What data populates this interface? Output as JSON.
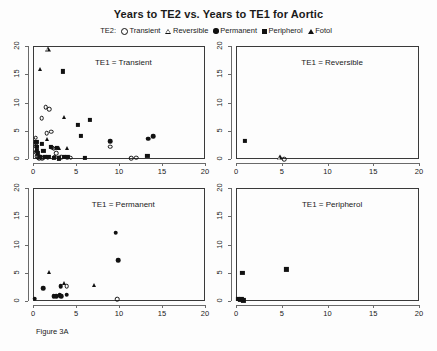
{
  "figure": {
    "title": "Years to TE2 vs. Years to TE1 for Aortic",
    "caption": "Figure 3A",
    "legend_prefix": "TE2:"
  },
  "legend": {
    "entries": [
      {
        "label": "Transient",
        "glyph": "open-circle-icon"
      },
      {
        "label": "Reversible",
        "glyph": "open-triangle-icon"
      },
      {
        "label": "Permanent",
        "glyph": "filled-circle-icon"
      },
      {
        "label": "Peripherol",
        "glyph": "filled-square-icon"
      },
      {
        "label": "Fotol",
        "glyph": "filled-triangle-icon"
      }
    ]
  },
  "axes": {
    "xticks": [
      "0",
      "5",
      "10",
      "15",
      "20"
    ],
    "yticks": [
      "0",
      "5",
      "10",
      "15",
      "20"
    ],
    "xlim": [
      0,
      20
    ],
    "ylim": [
      0,
      20
    ]
  },
  "panels": [
    {
      "label": "TE1 = Transient"
    },
    {
      "label": "TE1 = Reversible"
    },
    {
      "label": "TE1 = Permanent"
    },
    {
      "label": "TE1 = Peripherol"
    }
  ],
  "chart_data": {
    "type": "scatter",
    "title": "Years to TE2 vs. Years to TE1 for Aortic",
    "xlabel": "Years to TE1",
    "ylabel": "Years to TE2",
    "xlim": [
      0,
      20
    ],
    "ylim": [
      0,
      20
    ],
    "grid": false,
    "legend_position": "top-center",
    "legend_title": "TE2:",
    "series_markers": {
      "Transient": "open-circle",
      "Reversible": "open-triangle",
      "Permanent": "filled-circle",
      "Peripherol": "filled-square",
      "Fotol": "filled-triangle"
    },
    "panels": [
      {
        "label": "TE1 = Transient",
        "series": [
          {
            "name": "Transient",
            "points": [
              [
                0.3,
                3.8
              ],
              [
                0.3,
                2.9
              ],
              [
                0.4,
                2.3
              ],
              [
                0.4,
                1.2
              ],
              [
                0.5,
                0.5
              ],
              [
                0.6,
                0.2
              ],
              [
                0.7,
                0.1
              ],
              [
                0.9,
                0.3
              ],
              [
                1.0,
                7.2
              ],
              [
                1.1,
                0.1
              ],
              [
                1.2,
                0.2
              ],
              [
                1.5,
                9.2
              ],
              [
                1.6,
                4.6
              ],
              [
                1.7,
                0.2
              ],
              [
                1.9,
                8.8
              ],
              [
                2.1,
                4.8
              ],
              [
                2.2,
                2.0
              ],
              [
                2.4,
                1.8
              ],
              [
                2.5,
                0.4
              ],
              [
                2.7,
                1.0
              ],
              [
                3.0,
                0.2
              ],
              [
                3.3,
                0.3
              ],
              [
                4.0,
                0.2
              ],
              [
                4.4,
                0.2
              ],
              [
                9.0,
                2.2
              ],
              [
                11.4,
                0.1
              ],
              [
                12.0,
                0.2
              ]
            ]
          },
          {
            "name": "Reversible",
            "points": [
              [
                1.7,
                19.5
              ]
            ]
          },
          {
            "name": "Permanent",
            "points": [
              [
                9.0,
                3.2
              ],
              [
                13.4,
                3.6
              ],
              [
                14.0,
                4.0
              ]
            ]
          },
          {
            "name": "Peripherol",
            "points": [
              [
                0.4,
                3.0
              ],
              [
                0.5,
                2.1
              ],
              [
                0.5,
                1.4
              ],
              [
                0.6,
                1.0
              ],
              [
                0.8,
                0.4
              ],
              [
                1.0,
                2.6
              ],
              [
                1.2,
                1.4
              ],
              [
                1.4,
                0.3
              ],
              [
                1.8,
                0.3
              ],
              [
                2.1,
                2.1
              ],
              [
                2.4,
                0.2
              ],
              [
                2.8,
                2.0
              ],
              [
                3.0,
                0.1
              ],
              [
                3.5,
                15.5
              ],
              [
                3.6,
                0.3
              ],
              [
                4.0,
                0.3
              ],
              [
                5.2,
                6.0
              ],
              [
                5.6,
                4.1
              ],
              [
                6.0,
                0.2
              ],
              [
                6.6,
                6.9
              ],
              [
                13.3,
                0.5
              ]
            ]
          },
          {
            "name": "Fotol",
            "points": [
              [
                0.8,
                16.0
              ],
              [
                1.6,
                3.6
              ],
              [
                2.4,
                0.4
              ],
              [
                3.0,
                1.9
              ],
              [
                3.6,
                7.5
              ],
              [
                4.0,
                2.0
              ]
            ]
          }
        ]
      },
      {
        "label": "TE1 = Reversible",
        "series": [
          {
            "name": "Transient",
            "points": [
              [
                5.3,
                0.0
              ]
            ]
          },
          {
            "name": "Reversible",
            "points": [
              [
                4.8,
                0.35
              ]
            ]
          },
          {
            "name": "Peripherol",
            "points": [
              [
                1.0,
                3.2
              ]
            ]
          }
        ]
      },
      {
        "label": "TE1 = Permanent",
        "series": [
          {
            "name": "Transient",
            "points": [
              [
                3.9,
                2.6
              ],
              [
                9.8,
                0.3
              ]
            ]
          },
          {
            "name": "Permanent",
            "points": [
              [
                0.2,
                0.4
              ],
              [
                1.2,
                2.3
              ],
              [
                2.4,
                0.9
              ],
              [
                2.7,
                0.9
              ],
              [
                3.1,
                1.0
              ],
              [
                3.2,
                2.6
              ],
              [
                3.3,
                0.8
              ],
              [
                3.9,
                1.1
              ],
              [
                9.6,
                12.1
              ],
              [
                9.9,
                7.2
              ]
            ]
          },
          {
            "name": "Fotol",
            "points": [
              [
                1.9,
                5.1
              ],
              [
                3.6,
                3.1
              ],
              [
                7.1,
                2.8
              ]
            ]
          }
        ]
      },
      {
        "label": "TE1 = Peripherol",
        "series": [
          {
            "name": "Peripherol",
            "points": [
              [
                0.2,
                0.3
              ],
              [
                0.4,
                0.2
              ],
              [
                0.6,
                0.4
              ],
              [
                0.7,
                5.0
              ],
              [
                0.8,
                0.1
              ],
              [
                5.5,
                5.6
              ]
            ]
          }
        ]
      }
    ]
  }
}
